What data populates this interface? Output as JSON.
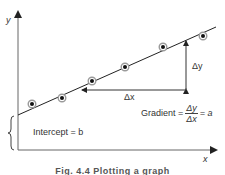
{
  "diagram": {
    "axes": {
      "y_label": "y",
      "x_label": "x"
    },
    "annotations": {
      "delta_y": "Δy",
      "delta_x": "Δx",
      "gradient_prefix": "Gradient =",
      "gradient_num": "Δy",
      "gradient_den": "Δx",
      "gradient_suffix": "= a",
      "intercept": "Intercept = b"
    },
    "caption": "Fig. 4.4   Plotting a graph",
    "colors": {
      "line": "#222222",
      "axis": "#555555",
      "point_fill": "#111111",
      "point_ring": "#9a9a9a"
    },
    "points": [
      {
        "x": 32,
        "y": 104
      },
      {
        "x": 62,
        "y": 98
      },
      {
        "x": 92,
        "y": 81
      },
      {
        "x": 125,
        "y": 67
      },
      {
        "x": 163,
        "y": 47
      },
      {
        "x": 203,
        "y": 36
      }
    ]
  }
}
